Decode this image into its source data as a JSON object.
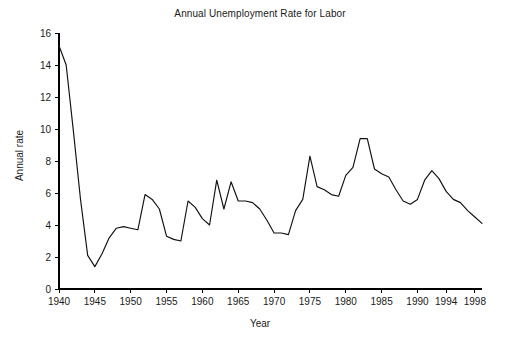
{
  "chart_data": {
    "type": "line",
    "title": "Annual Unemployment Rate for Labor",
    "xlabel": "Year",
    "ylabel": "Annual rate",
    "xlim": [
      1940,
      1999
    ],
    "ylim": [
      0,
      16
    ],
    "grid": false,
    "legend": "none",
    "x_ticks": [
      1940,
      1945,
      1950,
      1955,
      1960,
      1965,
      1970,
      1975,
      1980,
      1985,
      1990,
      1994,
      1998
    ],
    "y_ticks": [
      0,
      2,
      4,
      6,
      8,
      10,
      12,
      14,
      16
    ],
    "series": [
      {
        "name": "Annual Unemployment Rate",
        "x": [
          1940,
          1941,
          1942,
          1943,
          1944,
          1945,
          1946,
          1947,
          1948,
          1949,
          1950,
          1951,
          1952,
          1953,
          1954,
          1955,
          1956,
          1957,
          1958,
          1959,
          1960,
          1961,
          1962,
          1963,
          1964,
          1965,
          1966,
          1967,
          1968,
          1969,
          1970,
          1971,
          1972,
          1973,
          1974,
          1975,
          1976,
          1977,
          1978,
          1979,
          1980,
          1981,
          1982,
          1983,
          1984,
          1985,
          1986,
          1987,
          1988,
          1989,
          1990,
          1991,
          1992,
          1993,
          1994,
          1995,
          1996,
          1997,
          1998,
          1999
        ],
        "values": [
          15.2,
          14.0,
          9.9,
          5.6,
          2.1,
          1.4,
          2.2,
          3.2,
          3.8,
          3.9,
          3.8,
          3.7,
          5.9,
          5.6,
          5.0,
          3.3,
          3.1,
          3.0,
          5.5,
          5.1,
          4.4,
          4.0,
          6.8,
          5.0,
          6.7,
          5.5,
          5.5,
          5.4,
          5.0,
          4.3,
          3.5,
          3.5,
          3.4,
          4.9,
          5.6,
          8.3,
          6.4,
          6.2,
          5.9,
          5.8,
          7.1,
          7.6,
          9.4,
          9.4,
          7.5,
          7.2,
          7.0,
          6.2,
          5.5,
          5.3,
          5.6,
          6.8,
          7.4,
          6.9,
          6.1,
          5.6,
          5.4,
          4.9,
          4.5,
          4.1
        ]
      }
    ]
  }
}
